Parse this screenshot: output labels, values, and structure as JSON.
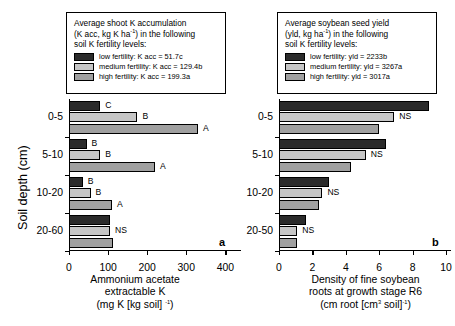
{
  "chart_data": [
    {
      "type": "bar",
      "panel": "a",
      "orientation": "horizontal",
      "title": "Average shoot K accumulation (K acc, kg K ha-1) in the following soil K fertility levels:",
      "xlabel": "Ammonium acetate extractable K (mg K [kg soil] -1)",
      "ylabel": "Soil depth (cm)",
      "categories": [
        "0-5",
        "5-10",
        "10-20",
        "20-60"
      ],
      "xticks": [
        0,
        100,
        200,
        300,
        400
      ],
      "xlim": [
        0,
        440
      ],
      "grid": false,
      "legend_position": "above-plot",
      "series": [
        {
          "name": "low fertility",
          "values": [
            80,
            45,
            35,
            105
          ],
          "color": "#2b2b2b"
        },
        {
          "name": "medium fertility",
          "values": [
            175,
            80,
            55,
            105
          ],
          "color": "#c6c6c6"
        },
        {
          "name": "high fertility",
          "values": [
            330,
            220,
            110,
            112
          ],
          "color": "#a0a0a0"
        }
      ],
      "annotations": [
        {
          "category": "0-5",
          "series": "low fertility",
          "text": "C"
        },
        {
          "category": "0-5",
          "series": "medium fertility",
          "text": "B"
        },
        {
          "category": "0-5",
          "series": "high fertility",
          "text": "A"
        },
        {
          "category": "5-10",
          "series": "low fertility",
          "text": "B"
        },
        {
          "category": "5-10",
          "series": "medium fertility",
          "text": "B"
        },
        {
          "category": "5-10",
          "series": "high fertility",
          "text": "A"
        },
        {
          "category": "10-20",
          "series": "low fertility",
          "text": "B"
        },
        {
          "category": "10-20",
          "series": "medium fertility",
          "text": "B"
        },
        {
          "category": "10-20",
          "series": "high fertility",
          "text": "A"
        },
        {
          "category": "20-60",
          "series": "medium fertility",
          "text": "NS"
        }
      ]
    },
    {
      "type": "bar",
      "panel": "b",
      "orientation": "horizontal",
      "title": "Average soybean seed yield (yld, kg ha-1) in the following soil K fertility levels:",
      "xlabel": "Density of fine soybean roots at growth stage R6 (cm root [cm3 soil]-1)",
      "ylabel": "Soil depth (cm)",
      "categories": [
        "0-5",
        "5-10",
        "10-20",
        "20-50"
      ],
      "xticks": [
        0,
        2,
        4,
        6,
        8,
        10
      ],
      "xlim": [
        0,
        10.3
      ],
      "grid": false,
      "legend_position": "above-plot",
      "series": [
        {
          "name": "low fertility",
          "values": [
            9.0,
            6.4,
            3.0,
            1.6
          ],
          "color": "#2b2b2b"
        },
        {
          "name": "medium fertility",
          "values": [
            6.9,
            5.2,
            2.6,
            1.1
          ],
          "color": "#c6c6c6"
        },
        {
          "name": "high fertility",
          "values": [
            6.0,
            4.3,
            2.4,
            1.1
          ],
          "color": "#a0a0a0"
        }
      ],
      "annotations": [
        {
          "category": "0-5",
          "series": "medium fertility",
          "text": "NS"
        },
        {
          "category": "5-10",
          "series": "medium fertility",
          "text": "NS"
        },
        {
          "category": "10-20",
          "series": "medium fertility",
          "text": "NS"
        },
        {
          "category": "20-50",
          "series": "medium fertility",
          "text": "NS"
        }
      ]
    }
  ],
  "panel_a": {
    "letter": "a",
    "legend": {
      "line1": "Average shoot K accumulation",
      "line2_pre": "(K acc, kg K ha",
      "line2_sup": "-1",
      "line2_post": ") in the following",
      "line3": "soil K fertility levels:",
      "items": [
        {
          "label": "low fertility: K acc = 51.7c"
        },
        {
          "label": "medium fertility: K acc = 129.4b"
        },
        {
          "label": "high fertility: K acc = 199.3a"
        }
      ]
    },
    "ylabel": "Soil depth (cm)",
    "ycats": [
      "0-5",
      "5-10",
      "10-20",
      "20-60"
    ],
    "xticklabels": [
      "0",
      "100",
      "200",
      "300",
      "400"
    ],
    "xtitle_line1": "Ammonium acetate",
    "xtitle_line2": "extractable K",
    "xtitle_line3_pre": "(mg K [kg soil] ",
    "xtitle_line3_sup": "-1",
    "xtitle_line3_post": ")",
    "barlabels": [
      "C",
      "B",
      "A",
      "B",
      "B",
      "A",
      "B",
      "B",
      "A",
      "NS"
    ]
  },
  "panel_b": {
    "letter": "b",
    "legend": {
      "line1": "Average soybean seed yield",
      "line2_pre": "(yld, kg ha",
      "line2_sup": "-1",
      "line2_post": ") in the following",
      "line3": "soil K fertility levels:",
      "items": [
        {
          "label": "low fertility: yld = 2233b"
        },
        {
          "label": "medium fertility: yld = 3267a"
        },
        {
          "label": "high fertility: yld = 3017a"
        }
      ]
    },
    "ycats": [
      "0-5",
      "5-10",
      "10-20",
      "20-50"
    ],
    "xticklabels": [
      "0",
      "2",
      "4",
      "6",
      "8",
      "10"
    ],
    "xtitle_line1": "Density of fine soybean",
    "xtitle_line2": "roots at growth stage R6",
    "xtitle_line3_pre": "(cm root [cm",
    "xtitle_line3_sup1": "3",
    "xtitle_line3_mid": " soil]",
    "xtitle_line3_sup2": "-1",
    "xtitle_line3_post": ")",
    "barlabels": [
      "NS",
      "NS",
      "NS",
      "NS"
    ]
  },
  "colors": {
    "low": "#2b2b2b",
    "medium": "#c6c6c6",
    "high": "#a0a0a0",
    "axis": "#000000",
    "background": "#ffffff"
  }
}
